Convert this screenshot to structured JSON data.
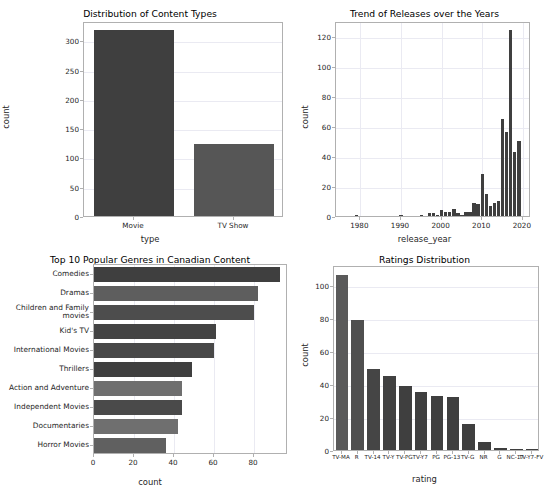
{
  "figure": {
    "width": 549,
    "height": 495,
    "background": "#ffffff"
  },
  "colors": {
    "bar_dark": "#3f3f3f",
    "bar_medium": "#565656",
    "bar_light": "#6b6b6b",
    "grid": "#eaeaf2",
    "axis": "#b0b0b0",
    "text": "#262626"
  },
  "chart_data": [
    {
      "id": "content-types",
      "type": "bar",
      "title": "Distribution of Content Types",
      "xlabel": "type",
      "ylabel": "count",
      "categories": [
        "Movie",
        "TV Show"
      ],
      "values": [
        317,
        123
      ],
      "ylim": [
        0,
        333
      ],
      "yticks": [
        0,
        50,
        100,
        150,
        200,
        250,
        300
      ],
      "grid": true,
      "legend": "none",
      "bar_colors": [
        "#3f3f3f",
        "#565656"
      ]
    },
    {
      "id": "release-trend",
      "type": "bar",
      "title": "Trend of Releases over the Years",
      "xlabel": "release_year",
      "ylabel": "count",
      "xlim": [
        1974,
        2022
      ],
      "ylim": [
        0,
        130
      ],
      "yticks": [
        0,
        20,
        40,
        60,
        80,
        100,
        120
      ],
      "xticks": [
        1980,
        1990,
        2000,
        2010,
        2020
      ],
      "grid": true,
      "legend": "none",
      "bar_color": "#3f3f3f",
      "x": [
        1976,
        1977,
        1978,
        1979,
        1980,
        1981,
        1982,
        1983,
        1984,
        1985,
        1986,
        1987,
        1988,
        1989,
        1990,
        1991,
        1992,
        1993,
        1994,
        1995,
        1996,
        1997,
        1998,
        1999,
        2000,
        2001,
        2002,
        2003,
        2004,
        2005,
        2006,
        2007,
        2008,
        2009,
        2010,
        2011,
        2012,
        2013,
        2014,
        2015,
        2016,
        2017,
        2018,
        2019,
        2020
      ],
      "values": [
        0,
        0,
        0,
        1,
        0,
        0,
        0,
        0,
        0,
        0,
        0,
        0,
        0,
        0,
        1,
        0,
        0,
        0,
        0,
        1,
        0,
        2,
        2,
        1,
        4,
        3,
        3,
        5,
        2,
        1,
        3,
        3,
        9,
        8,
        28,
        15,
        7,
        9,
        10,
        65,
        56,
        124,
        43,
        50,
        0
      ]
    },
    {
      "id": "top-genres",
      "type": "bar",
      "orientation": "horizontal",
      "title": "Top 10 Popular Genres in Canadian Content",
      "xlabel": "count",
      "ylabel": "",
      "categories": [
        "Comedies",
        "Dramas",
        "Children and Family\nmovies",
        "Kid's TV",
        "International Movies",
        "Thrillers",
        "Action and Adventure",
        "Independent Movies",
        "Documentaries",
        "Horror Movies"
      ],
      "values": [
        93,
        82,
        80,
        61,
        60,
        49,
        44,
        44,
        42,
        36
      ],
      "xlim": [
        0,
        97
      ],
      "xticks": [
        0,
        20,
        40,
        60,
        80
      ],
      "grid": true,
      "legend": "none",
      "bar_colors": [
        "#3f3f3f",
        "#5e5e5e",
        "#4d4d4d",
        "#434343",
        "#484848",
        "#3f3f3f",
        "#6f6f6f",
        "#4a4a4a",
        "#6f6f6f",
        "#606060"
      ]
    },
    {
      "id": "ratings-distribution",
      "type": "bar",
      "title": "Ratings Distribution",
      "xlabel": "rating",
      "ylabel": "count",
      "categories": [
        "TV-MA",
        "R",
        "TV-14",
        "TV-Y",
        "TV-PG",
        "TV-Y7",
        "PG",
        "PG-13",
        "TV-G",
        "NR",
        "G",
        "NC-17",
        "TV-Y7-FV"
      ],
      "values": [
        106,
        79,
        49,
        45,
        39,
        35,
        33,
        32,
        16,
        5,
        1.5,
        0.5,
        0.5
      ],
      "ylim": [
        0,
        112
      ],
      "yticks": [
        0,
        20,
        40,
        60,
        80,
        100
      ],
      "grid": true,
      "legend": "none",
      "bar_colors": [
        "#5a5a5a",
        "#4f4f4f",
        "#454545",
        "#414141",
        "#3f3f3f",
        "#3f3f3f",
        "#3f3f3f",
        "#3f3f3f",
        "#3f3f3f",
        "#3f3f3f",
        "#3f3f3f",
        "#3f3f3f",
        "#3f3f3f"
      ]
    }
  ]
}
